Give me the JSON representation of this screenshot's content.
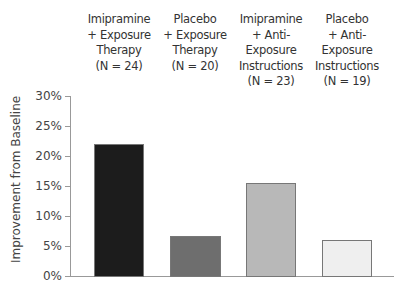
{
  "chart_data": {
    "type": "bar",
    "title": "",
    "xlabel": "",
    "ylabel": "Improvement from Baseline",
    "ylim": [
      0,
      30
    ],
    "yticks": [
      "0%",
      "5%",
      "10%",
      "15%",
      "20%",
      "25%",
      "30%"
    ],
    "grid": false,
    "legend": null,
    "categories": [
      "Imipramine + Exposure Therapy (N = 24)",
      "Placebo + Exposure Therapy (N = 20)",
      "Imipramine + Anti-Exposure Instructions (N = 23)",
      "Placebo + Anti-Exposure Instructions (N = 19)"
    ],
    "category_lines": [
      [
        "Imipramine",
        "+ Exposure",
        "Therapy",
        "(N = 24)"
      ],
      [
        "Placebo",
        "+ Exposure",
        "Therapy",
        "(N = 20)"
      ],
      [
        "Imipramine",
        "+ Anti-",
        "Exposure",
        "Instructions",
        "(N = 23)"
      ],
      [
        "Placebo",
        "+ Anti-",
        "Exposure",
        "Instructions",
        "(N = 19)"
      ]
    ],
    "values": [
      22,
      6.7,
      15.5,
      6
    ],
    "unit": "%",
    "bar_colors": [
      "#1c1c1c",
      "#6e6e6e",
      "#b8b8b8",
      "#efefef"
    ]
  }
}
